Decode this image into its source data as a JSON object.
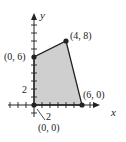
{
  "diagram": {
    "type": "feasible-region",
    "axes": {
      "x_label": "x",
      "y_label": "y",
      "tick_label_x": "2",
      "tick_label_y": "2"
    },
    "vertices": [
      {
        "label": "(0, 0)",
        "x": 0,
        "y": 0
      },
      {
        "label": "(0, 6)",
        "x": 0,
        "y": 6
      },
      {
        "label": "(4, 8)",
        "x": 4,
        "y": 8
      },
      {
        "label": "(6, 0)",
        "x": 6,
        "y": 0
      }
    ],
    "fill_color": "#cfcfcf",
    "line_color": "#222222"
  }
}
